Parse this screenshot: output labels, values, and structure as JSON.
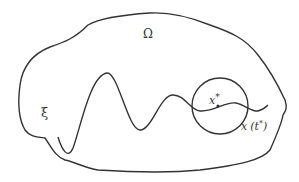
{
  "diagram": {
    "region_label": "Ω",
    "curve_label": "ξ",
    "point_label": "x",
    "point_superscript": "*",
    "exit_label_main": "x",
    "exit_label_arg": "(t",
    "exit_label_sup": "*",
    "exit_label_close": ")",
    "colors": {
      "stroke": "#333333",
      "background": "#ffffff"
    }
  }
}
